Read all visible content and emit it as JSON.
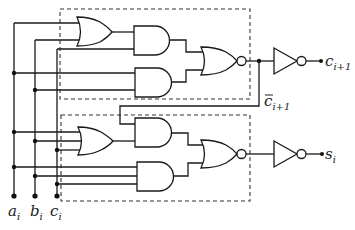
{
  "diagram": {
    "inputs": [
      {
        "name": "a",
        "subscript": "i"
      },
      {
        "name": "b",
        "subscript": "i"
      },
      {
        "name": "c",
        "subscript": "i"
      }
    ],
    "outputs": {
      "carry": {
        "name": "c",
        "subscript": "i+1"
      },
      "carry_bar": {
        "name": "c",
        "subscript": "i+1",
        "overbar": true
      },
      "sum": {
        "name": "s",
        "subscript": "i"
      }
    },
    "blocks": [
      {
        "id": "carry-block",
        "gates": [
          "OR(a,b)",
          "AND(OR,c)",
          "AND(a,b)",
          "NOR"
        ]
      },
      {
        "id": "sum-block",
        "gates": [
          "OR(a,b,c)",
          "AND(c_bar,OR)",
          "AND(a,b,c)",
          "NOR"
        ]
      }
    ],
    "buffers": [
      "inverter-carry",
      "inverter-sum"
    ]
  }
}
